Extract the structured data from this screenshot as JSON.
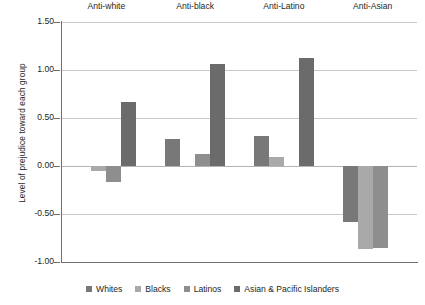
{
  "chart_data": {
    "type": "bar",
    "title": "",
    "xlabel": "",
    "ylabel": "Level of prejudice toward each group",
    "ylim": [
      -1.0,
      1.5
    ],
    "yticks": [
      "1.50",
      "1.00",
      "0.50",
      "0.00",
      "-0.50",
      "-1.00"
    ],
    "ytick_values": [
      1.5,
      1.0,
      0.5,
      0.0,
      -0.5,
      -1.0
    ],
    "grid": true,
    "legend_position": "bottom",
    "categories": [
      "Anti-white",
      "Anti-black",
      "Anti-Latino",
      "Anti-Asian"
    ],
    "series": [
      {
        "name": "Whites",
        "color": "#787878",
        "values": [
          null,
          0.28,
          0.31,
          -0.58
        ]
      },
      {
        "name": "Blacks",
        "color": "#a9a9a9",
        "values": [
          -0.05,
          null,
          0.09,
          -0.86
        ]
      },
      {
        "name": "Latinos",
        "color": "#8e8e8e",
        "values": [
          -0.17,
          0.12,
          null,
          -0.85
        ]
      },
      {
        "name": "Asian & Pacific Islanders",
        "color": "#6b6b6b",
        "values": [
          0.67,
          1.06,
          1.12,
          null
        ]
      }
    ]
  },
  "axis": {
    "line_color": "#6f6f6f",
    "grid_color": "#c9c9c9",
    "zero_line_color": "#b4b4b4"
  }
}
